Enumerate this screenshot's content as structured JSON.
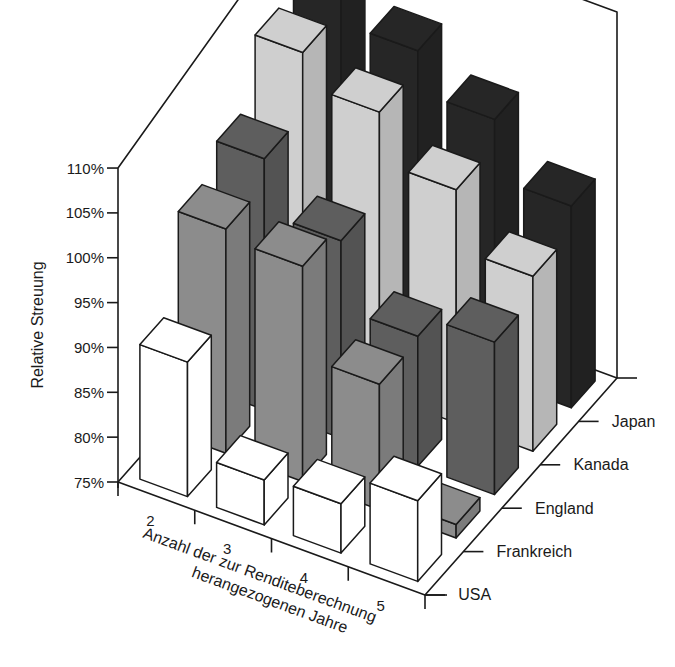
{
  "chart_data": {
    "type": "bar",
    "subtype": "3d-bar",
    "title": "",
    "ylabel": "Relative Streuung",
    "xlabel": "Anzahl der zur Renditeberechnung herangezogenen Jahre",
    "xlabel_lines": [
      "Anzahl der zur Renditeberechnung",
      "herangezogenen Jahre"
    ],
    "categories": [
      "2",
      "3",
      "4",
      "5"
    ],
    "depth_categories": [
      "USA",
      "Frankreich",
      "England",
      "Kanada",
      "Japan"
    ],
    "yticks": [
      "75%",
      "80%",
      "85%",
      "90%",
      "95%",
      "100%",
      "105%",
      "110%"
    ],
    "ylim": [
      75,
      110
    ],
    "grid": false,
    "legend": "none (depth axis labels)",
    "series": [
      {
        "name": "USA",
        "color": "#ffffff",
        "values": [
          90,
          80,
          80.5,
          84
        ]
      },
      {
        "name": "Frankreich",
        "color": "#8c8c8c",
        "values": [
          100,
          99,
          89,
          76.5
        ]
      },
      {
        "name": "England",
        "color": "#5e5e5e",
        "values": [
          103,
          97,
          89.5,
          92
        ]
      },
      {
        "name": "Kanada",
        "color": "#cfcfcf",
        "values": [
          110,
          106.5,
          101,
          94.5
        ]
      },
      {
        "name": "Japan",
        "color": "#262626",
        "values": [
          115,
          108.5,
          104,
          97.5
        ]
      }
    ]
  }
}
